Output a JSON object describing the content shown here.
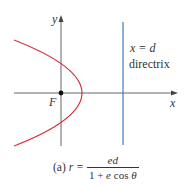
{
  "diagram": {
    "axes": {
      "x_label": "x",
      "y_label": "y"
    },
    "focus_label": "F",
    "directrix": {
      "equation": "x = d",
      "label": "directrix",
      "color": "#3a7fc0"
    },
    "curve": {
      "type": "parabola",
      "opens": "left",
      "color": "#d9303a"
    },
    "caption": {
      "part": "(a)",
      "lhs": "r =",
      "numerator": "ed",
      "denominator_a": "1 + ",
      "denominator_e": "e",
      "denominator_cos": " cos ",
      "denominator_theta": "θ"
    }
  }
}
